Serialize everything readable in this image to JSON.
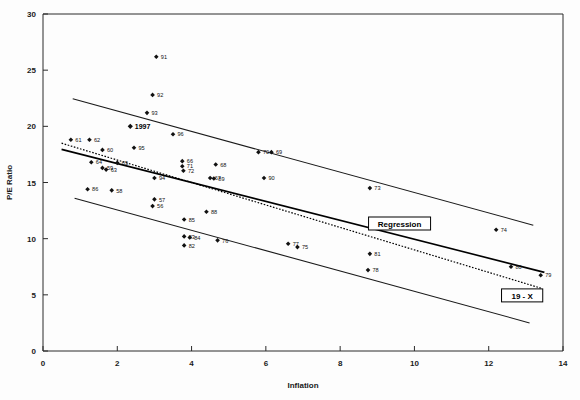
{
  "chart_data": {
    "type": "scatter",
    "title": "",
    "xlabel": "Inflation",
    "ylabel": "P/E Ratio",
    "xlim": [
      0,
      14
    ],
    "ylim": [
      0,
      30
    ],
    "xticks": [
      0,
      2,
      4,
      6,
      8,
      10,
      12,
      14
    ],
    "yticks": [
      0,
      5,
      10,
      15,
      20,
      25,
      30
    ],
    "grid": false,
    "legend_position": "inline-annotations",
    "points": [
      {
        "label": "91",
        "x": 3.05,
        "y": 26.2
      },
      {
        "label": "92",
        "x": 2.95,
        "y": 22.8
      },
      {
        "label": "93",
        "x": 2.8,
        "y": 21.2
      },
      {
        "label": "1997",
        "x": 2.35,
        "y": 20.0,
        "bold": true
      },
      {
        "label": "96",
        "x": 3.5,
        "y": 19.3
      },
      {
        "label": "61",
        "x": 0.75,
        "y": 18.8
      },
      {
        "label": "62",
        "x": 1.25,
        "y": 18.8
      },
      {
        "label": "95",
        "x": 2.45,
        "y": 18.1
      },
      {
        "label": "60",
        "x": 1.6,
        "y": 17.9
      },
      {
        "label": "70",
        "x": 5.8,
        "y": 17.7
      },
      {
        "label": "69",
        "x": 6.15,
        "y": 17.7
      },
      {
        "label": "64",
        "x": 1.3,
        "y": 16.8
      },
      {
        "label": "65",
        "x": 2.0,
        "y": 16.75
      },
      {
        "label": "66",
        "x": 3.75,
        "y": 16.9
      },
      {
        "label": "68",
        "x": 4.65,
        "y": 16.6
      },
      {
        "label": "71",
        "x": 3.75,
        "y": 16.45
      },
      {
        "label": "59",
        "x": 1.6,
        "y": 16.3
      },
      {
        "label": "63",
        "x": 1.7,
        "y": 16.15
      },
      {
        "label": "72",
        "x": 3.78,
        "y": 16.05
      },
      {
        "label": "67",
        "x": 4.5,
        "y": 15.4
      },
      {
        "label": "94",
        "x": 3.0,
        "y": 15.4
      },
      {
        "label": "89",
        "x": 4.6,
        "y": 15.35
      },
      {
        "label": "90",
        "x": 5.95,
        "y": 15.4
      },
      {
        "label": "73",
        "x": 8.8,
        "y": 14.5
      },
      {
        "label": "86",
        "x": 1.2,
        "y": 14.4
      },
      {
        "label": "58",
        "x": 1.85,
        "y": 14.3
      },
      {
        "label": "57",
        "x": 3.0,
        "y": 13.5
      },
      {
        "label": "56",
        "x": 2.95,
        "y": 12.9
      },
      {
        "label": "88",
        "x": 4.4,
        "y": 12.4
      },
      {
        "label": "85",
        "x": 3.8,
        "y": 11.7
      },
      {
        "label": "74",
        "x": 12.2,
        "y": 10.8
      },
      {
        "label": "83",
        "x": 3.8,
        "y": 10.2
      },
      {
        "label": "84",
        "x": 3.95,
        "y": 10.1
      },
      {
        "label": "76",
        "x": 4.7,
        "y": 9.85
      },
      {
        "label": "77",
        "x": 6.6,
        "y": 9.55
      },
      {
        "label": "75",
        "x": 6.85,
        "y": 9.25
      },
      {
        "label": "82",
        "x": 3.8,
        "y": 9.4
      },
      {
        "label": "81",
        "x": 8.8,
        "y": 8.65
      },
      {
        "label": "78",
        "x": 8.75,
        "y": 7.2
      },
      {
        "label": "80",
        "x": 12.6,
        "y": 7.5
      },
      {
        "label": "79",
        "x": 13.4,
        "y": 6.75
      }
    ],
    "lines": [
      {
        "name": "regression",
        "style": "solid",
        "label": "Regression",
        "x": [
          0.5,
          13.5
        ],
        "y": [
          17.95,
          7.0
        ]
      },
      {
        "name": "upper-band",
        "style": "solid",
        "label": "",
        "x": [
          0.8,
          13.2
        ],
        "y": [
          22.45,
          11.2
        ]
      },
      {
        "name": "lower-band",
        "style": "solid",
        "label": "",
        "x": [
          0.85,
          13.1
        ],
        "y": [
          13.6,
          2.5
        ]
      },
      {
        "name": "19-minus-x",
        "style": "dotted",
        "label": "19 - X",
        "x": [
          0.5,
          13.4
        ],
        "y": [
          18.5,
          5.6
        ]
      }
    ],
    "annotations": [
      {
        "name": "regression-label",
        "text": "Regression",
        "x": 9.6,
        "y": 11.35,
        "boxed": true
      },
      {
        "name": "identity-label",
        "text": "19 - X",
        "x": 12.9,
        "y": 4.95,
        "boxed": true
      }
    ]
  }
}
